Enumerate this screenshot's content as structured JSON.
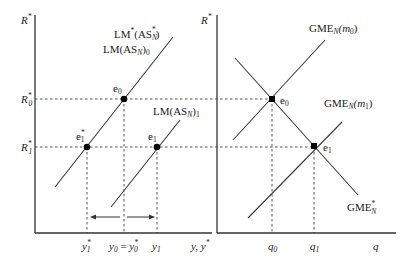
{
  "left_panel": {
    "y_axis_label": {
      "base": "R",
      "sup": "*"
    },
    "x_axis_label": "y, y",
    "x_axis_label_sup": "*",
    "curves": [
      {
        "id": "lm-star",
        "label_main": "LM",
        "label_sup": "*",
        "label_paren": "(AS",
        "label_sub": "N",
        "label_sup2": "*",
        "label_close": ")"
      },
      {
        "id": "lm0",
        "label_main": "LM(AS",
        "label_sub": "N",
        "label_close": ")",
        "label_sub2": "0"
      },
      {
        "id": "lm1",
        "label_main": "LM(AS",
        "label_sub": "N",
        "label_close": ")",
        "label_sub2": "1"
      }
    ],
    "points": [
      {
        "id": "e0",
        "base": "e",
        "sub": "0"
      },
      {
        "id": "e1-star",
        "base": "e",
        "sub": "1",
        "sup": "*"
      },
      {
        "id": "e1",
        "base": "e",
        "sub": "1"
      }
    ],
    "y_ticks": [
      {
        "id": "R0",
        "base": "R",
        "sub": "0",
        "sup": "*"
      },
      {
        "id": "R1",
        "base": "R",
        "sub": "1",
        "sup": "*"
      }
    ],
    "x_ticks": [
      {
        "id": "y1-star",
        "text": "y",
        "sub": "1",
        "sup": "*"
      },
      {
        "id": "y0",
        "text": "y",
        "sub": "0",
        "eq": " = ",
        "text2": "y",
        "sub2": "0",
        "sup2": "*"
      },
      {
        "id": "y1",
        "text": "y",
        "sub": "1"
      }
    ]
  },
  "right_panel": {
    "y_axis_label": {
      "base": "R",
      "sup": "*"
    },
    "x_axis_label": "q",
    "curves": [
      {
        "id": "gme-m0",
        "label_main": "GME",
        "label_sub": "N",
        "label_paren": "(m",
        "label_sub2": "0",
        "label_close": ")"
      },
      {
        "id": "gme-m1",
        "label_main": "GME",
        "label_sub": "N",
        "label_paren": "(m",
        "label_sub2": "1",
        "label_close": ")"
      },
      {
        "id": "gme-star",
        "label_main": "GME",
        "label_sub": "N",
        "label_sup": "*"
      }
    ],
    "points": [
      {
        "id": "e0",
        "base": "e",
        "sub": "0"
      },
      {
        "id": "e1",
        "base": "e",
        "sub": "1"
      }
    ],
    "x_ticks": [
      {
        "id": "q0",
        "text": "q",
        "sub": "0"
      },
      {
        "id": "q1",
        "text": "q",
        "sub": "1"
      }
    ]
  }
}
